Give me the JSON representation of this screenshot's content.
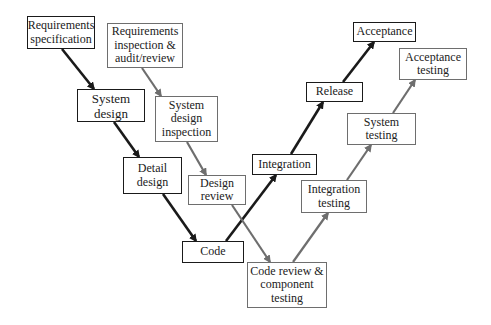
{
  "diagram": {
    "type": "v-model",
    "colors": {
      "development": "#1a1a1a",
      "verification": "#6e6e6e",
      "background": "#ffffff"
    },
    "nodes": [
      {
        "id": "req_spec",
        "label": "Requirements\nspecification",
        "kind": "dev",
        "x": 27,
        "y": 16,
        "w": 68,
        "h": 33
      },
      {
        "id": "req_insp",
        "label": "Requirements\ninspection &\naudit/review",
        "kind": "qa",
        "x": 107,
        "y": 23,
        "w": 76,
        "h": 45
      },
      {
        "id": "sys_design",
        "label": "System\ndesign",
        "kind": "dev",
        "x": 77,
        "y": 89,
        "w": 68,
        "h": 33
      },
      {
        "id": "sys_design_insp",
        "label": "System\ndesign\ninspection",
        "kind": "qa",
        "x": 155,
        "y": 96,
        "w": 63,
        "h": 46
      },
      {
        "id": "detail_design",
        "label": "Detail\ndesign",
        "kind": "dev",
        "x": 123,
        "y": 157,
        "w": 59,
        "h": 37
      },
      {
        "id": "design_review",
        "label": "Design\nreview",
        "kind": "qa",
        "x": 188,
        "y": 175,
        "w": 58,
        "h": 30
      },
      {
        "id": "code",
        "label": "Code",
        "kind": "dev",
        "x": 182,
        "y": 241,
        "w": 62,
        "h": 22
      },
      {
        "id": "code_review",
        "label": "Code review &\ncomponent\ntesting",
        "kind": "qa",
        "x": 247,
        "y": 262,
        "w": 80,
        "h": 46
      },
      {
        "id": "integration",
        "label": "Integration",
        "kind": "dev",
        "x": 252,
        "y": 154,
        "w": 65,
        "h": 21
      },
      {
        "id": "integration_testing",
        "label": "Integration\ntesting",
        "kind": "qa",
        "x": 301,
        "y": 180,
        "w": 66,
        "h": 33
      },
      {
        "id": "release",
        "label": "Release",
        "kind": "dev",
        "x": 306,
        "y": 82,
        "w": 57,
        "h": 20
      },
      {
        "id": "system_testing",
        "label": "System\ntesting",
        "kind": "qa",
        "x": 347,
        "y": 113,
        "w": 69,
        "h": 32
      },
      {
        "id": "acceptance",
        "label": "Acceptance",
        "kind": "dev",
        "x": 353,
        "y": 22,
        "w": 63,
        "h": 20
      },
      {
        "id": "acceptance_testing",
        "label": "Acceptance\ntesting",
        "kind": "qa",
        "x": 399,
        "y": 48,
        "w": 68,
        "h": 32
      }
    ],
    "edges": [
      {
        "from": "req_spec",
        "to": "sys_design",
        "kind": "dev"
      },
      {
        "from": "sys_design",
        "to": "detail_design",
        "kind": "dev"
      },
      {
        "from": "detail_design",
        "to": "code",
        "kind": "dev"
      },
      {
        "from": "code",
        "to": "integration",
        "kind": "dev"
      },
      {
        "from": "integration",
        "to": "release",
        "kind": "dev"
      },
      {
        "from": "release",
        "to": "acceptance",
        "kind": "dev"
      },
      {
        "from": "req_insp",
        "to": "sys_design_insp",
        "kind": "qa"
      },
      {
        "from": "sys_design_insp",
        "to": "design_review",
        "kind": "qa"
      },
      {
        "from": "design_review",
        "to": "code_review",
        "kind": "qa"
      },
      {
        "from": "code_review",
        "to": "integration_testing",
        "kind": "qa"
      },
      {
        "from": "integration_testing",
        "to": "system_testing",
        "kind": "qa"
      },
      {
        "from": "system_testing",
        "to": "acceptance_testing",
        "kind": "qa"
      }
    ]
  },
  "labels": {
    "req_spec": "Requirements\nspecification",
    "req_insp": "Requirements\ninspection &\naudit/review",
    "sys_design": "System\ndesign",
    "sys_design_insp": "System\ndesign\ninspection",
    "detail_design": "Detail\ndesign",
    "design_review": "Design\nreview",
    "code": "Code",
    "code_review": "Code review &\ncomponent\ntesting",
    "integration": "Integration",
    "integration_testing": "Integration\ntesting",
    "release": "Release",
    "system_testing": "System\ntesting",
    "acceptance": "Acceptance",
    "acceptance_testing": "Acceptance\ntesting"
  }
}
